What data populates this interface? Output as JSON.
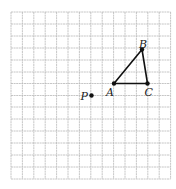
{
  "figure": {
    "grid": {
      "cols": 14,
      "rows": 14,
      "x_lines": [
        11,
        22.4,
        33.8,
        45.2,
        56.6,
        68,
        79.4,
        90.8,
        102.2,
        113.6,
        125,
        136.4,
        147.8,
        159.2,
        170.6
      ],
      "y_lines": [
        12,
        24,
        36,
        48,
        60,
        72,
        83.5,
        95.5,
        107,
        119,
        131,
        143,
        155,
        167,
        179
      ],
      "line_color": "#b8b8b8"
    },
    "points": [
      {
        "id": "A",
        "label": "A",
        "x": 114,
        "y": 83.5,
        "label_dx": -8,
        "label_dy": 12
      },
      {
        "id": "B",
        "label": "B",
        "x": 142,
        "y": 49.5,
        "label_dx": -3,
        "label_dy": -2
      },
      {
        "id": "C",
        "label": "C",
        "x": 147.5,
        "y": 83.5,
        "label_dx": -3,
        "label_dy": 12
      },
      {
        "id": "P",
        "label": "P",
        "x": 91.5,
        "y": 95.5,
        "label_dx": -11,
        "label_dy": 4
      }
    ],
    "triangle": [
      "A",
      "B",
      "C"
    ],
    "stroke_color": "#111111"
  }
}
